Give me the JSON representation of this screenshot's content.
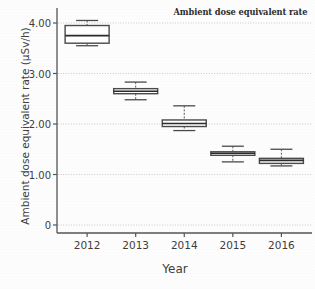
{
  "chart_data": {
    "type": "box",
    "title": "Ambient dose equivalent rate",
    "xlabel": "Year",
    "ylabel": "Ambient dose equivalent rate (µSv/h)",
    "categories": [
      "2012",
      "2013",
      "2014",
      "2015",
      "2016"
    ],
    "ylim": [
      0,
      4.3
    ],
    "ytick_values": [
      0,
      1.0,
      2.0,
      3.0,
      4.0
    ],
    "ytick_labels": [
      "0",
      "1.00",
      "2.00",
      "3.00",
      "4.00"
    ],
    "grid": "horizontal-dotted",
    "legend": "none",
    "boxes": [
      {
        "category": "2012",
        "whisker_low": 3.55,
        "q1": 3.6,
        "median": 3.75,
        "q3": 3.95,
        "whisker_high": 4.05
      },
      {
        "category": "2013",
        "whisker_low": 2.48,
        "q1": 2.6,
        "median": 2.65,
        "q3": 2.7,
        "whisker_high": 2.83
      },
      {
        "category": "2014",
        "whisker_low": 1.87,
        "q1": 1.95,
        "median": 2.01,
        "q3": 2.08,
        "whisker_high": 2.36
      },
      {
        "category": "2015",
        "whisker_low": 1.25,
        "q1": 1.38,
        "median": 1.42,
        "q3": 1.45,
        "whisker_high": 1.56
      },
      {
        "category": "2016",
        "whisker_low": 1.17,
        "q1": 1.22,
        "median": 1.28,
        "q3": 1.32,
        "whisker_high": 1.5
      }
    ],
    "colors": {
      "box_fill": "#ffffff",
      "box_edge": "#4a4a4a",
      "median": "#2b2b2b",
      "whisker": "#5a5a5a",
      "grid": "#c9c9c9",
      "axis": "#555555",
      "text": "#3d3d3d"
    }
  },
  "axis_geometry": {
    "plot_left": 57,
    "plot_right": 312,
    "y_zero_px": 225,
    "y_top_px": 8,
    "px_per_unit": 50.5,
    "box_half_width": 22,
    "cap_half_width": 11
  }
}
